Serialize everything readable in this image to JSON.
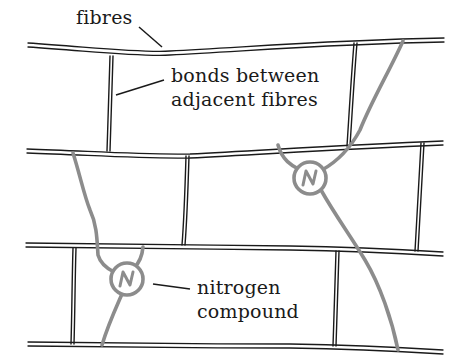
{
  "diagram": {
    "labels": {
      "fibres": "fibres",
      "bonds_line1": "bonds between",
      "bonds_line2": "adjacent fibres",
      "nitrogen_line1": "nitrogen",
      "nitrogen_line2": "compound"
    },
    "nitrogen_symbol": "N",
    "colors": {
      "fibre": "#1a1a1a",
      "nitrogen_chain": "#8c8c8c",
      "background": "#ffffff"
    }
  }
}
